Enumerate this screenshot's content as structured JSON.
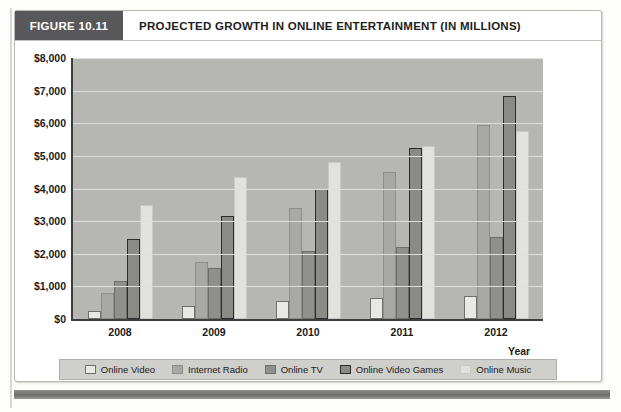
{
  "figure": {
    "tag": "FIGURE 10.11",
    "title": "PROJECTED GROWTH IN ONLINE ENTERTAINMENT (IN MILLIONS)"
  },
  "axis": {
    "x_title": "Year",
    "y_ticks": [
      "$8,000",
      "$7,000",
      "$6,000",
      "$5,000",
      "$4,000",
      "$3,000",
      "$2,000",
      "$1,000",
      "$0"
    ]
  },
  "legend": {
    "items": [
      {
        "label": "Online Video",
        "swatch": "legend-swatch-online-video"
      },
      {
        "label": "Internet Radio",
        "swatch": "legend-swatch-internet-radio"
      },
      {
        "label": "Online TV",
        "swatch": "legend-swatch-online-tv"
      },
      {
        "label": "Online Video Games",
        "swatch": "legend-swatch-online-video-games"
      },
      {
        "label": "Online Music",
        "swatch": "legend-swatch-online-music"
      }
    ]
  },
  "colors": {
    "tag_background": "#58585a",
    "plot_background": "#b6b6b2",
    "gridline": "#dededa",
    "legend_background": "#cfcfcb",
    "axis": "#3d3d3d",
    "online_video": "#e8e8e4",
    "internet_radio": "#a8a8a4",
    "online_tv": "#8f8f8c",
    "online_video_games": "#8a8a87",
    "online_music": "#e2e2dd"
  },
  "chart_data": {
    "type": "bar",
    "title": "PROJECTED GROWTH IN ONLINE ENTERTAINMENT (IN MILLIONS)",
    "xlabel": "Year",
    "ylabel": "",
    "ylim": [
      0,
      8000
    ],
    "ytick_step": 1000,
    "grid": true,
    "legend_position": "bottom",
    "categories": [
      "2008",
      "2009",
      "2010",
      "2011",
      "2012"
    ],
    "series": [
      {
        "name": "Online Video",
        "values": [
          250,
          400,
          550,
          650,
          700
        ]
      },
      {
        "name": "Internet Radio",
        "values": [
          800,
          1750,
          3400,
          4500,
          5950
        ]
      },
      {
        "name": "Online TV",
        "values": [
          1150,
          1550,
          2100,
          2200,
          2500
        ]
      },
      {
        "name": "Online Video Games",
        "values": [
          2450,
          3150,
          4000,
          5250,
          6850
        ]
      },
      {
        "name": "Online Music",
        "values": [
          3500,
          4350,
          4800,
          5300,
          5750
        ]
      }
    ]
  }
}
